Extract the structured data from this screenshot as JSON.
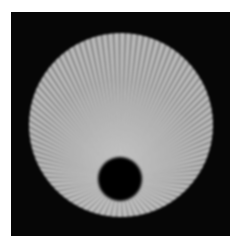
{
  "image": {
    "caption_fragment": "",
    "description": "Grayscale radial starburst phantom on black background with a dark circular hole near the bottom",
    "colors": {
      "background": "#060606",
      "ray_light": "#c9c9c9",
      "ray_dark": "#767676",
      "disc_base": "#9a9a9a",
      "hole": "#050505",
      "page": "#ffffff"
    },
    "disc": {
      "cx": 121,
      "cy": 125,
      "r": 92
    },
    "hole": {
      "cx": 120,
      "cy": 179,
      "r": 22
    },
    "ray_count": 96
  }
}
